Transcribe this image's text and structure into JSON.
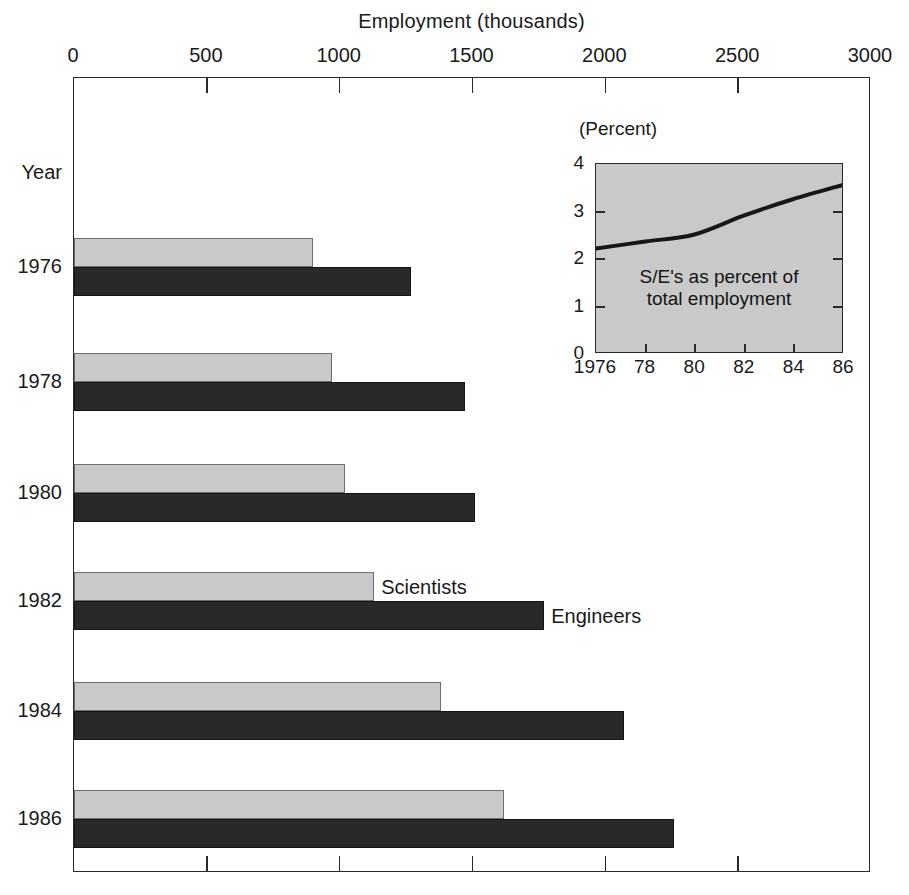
{
  "figure": {
    "axis_title": "Employment (thousands)",
    "year_axis_label": "Year",
    "background_color": "#ffffff",
    "frame_color": "#2b2b2b"
  },
  "main_axis": {
    "x_ticks": [
      0,
      500,
      1000,
      1500,
      2000,
      2500,
      3000
    ],
    "x_tick_labels": [
      "0",
      "500",
      "1000",
      "1500",
      "2000",
      "2500",
      "3000"
    ],
    "x_min": 0,
    "x_max": 3000
  },
  "years": [
    "1976",
    "1978",
    "1980",
    "1982",
    "1984",
    "1986"
  ],
  "series_annotations": [
    {
      "name": "scientists-annotation",
      "label": "Scientists"
    },
    {
      "name": "engineers-annotation",
      "label": "Engineers"
    }
  ],
  "colors": {
    "scientists": "#c9c9c9",
    "engineers": "#292929",
    "inset_background": "#c9c9c9",
    "line": "#171717"
  },
  "inset": {
    "unit_label": "(Percent)",
    "caption_line1": "S/E's as percent of",
    "caption_line2": "total employment",
    "y_ticks": [
      0,
      1,
      2,
      3,
      4
    ],
    "y_tick_labels": [
      "0",
      "1",
      "2",
      "3",
      "4"
    ],
    "x_tick_labels": [
      "1976",
      "78",
      "80",
      "82",
      "84",
      "86"
    ],
    "x_tick_values": [
      1976,
      1978,
      1980,
      1982,
      1984,
      1986
    ]
  },
  "chart_data": [
    {
      "type": "bar",
      "orientation": "horizontal",
      "title": "",
      "xlabel": "Employment (thousands)",
      "ylabel": "Year",
      "xlim": [
        0,
        3000
      ],
      "xticks": [
        0,
        500,
        1000,
        1500,
        2000,
        2500,
        3000
      ],
      "grid": false,
      "legend": "inline annotations at 1982 group",
      "categories": [
        "1976",
        "1978",
        "1980",
        "1982",
        "1984",
        "1986"
      ],
      "series": [
        {
          "name": "Scientists",
          "color": "#c9c9c9",
          "values": [
            900,
            970,
            1020,
            1130,
            1380,
            1620
          ]
        },
        {
          "name": "Engineers",
          "color": "#292929",
          "values": [
            1270,
            1470,
            1510,
            1770,
            2070,
            2260
          ]
        }
      ]
    },
    {
      "type": "line",
      "title": "S/E's as percent of total employment",
      "xlabel": "",
      "ylabel": "(Percent)",
      "ylim": [
        0,
        4
      ],
      "xlim": [
        1976,
        1986
      ],
      "yticks": [
        0,
        1,
        2,
        3,
        4
      ],
      "xticks": [
        1976,
        1978,
        1980,
        1982,
        1984,
        1986
      ],
      "grid": false,
      "legend": "none",
      "x": [
        1976,
        1978,
        1980,
        1982,
        1984,
        1986
      ],
      "series": [
        {
          "name": "S/E's as percent of total employment",
          "color": "#171717",
          "values": [
            2.2,
            2.35,
            2.5,
            2.9,
            3.25,
            3.55
          ]
        }
      ]
    }
  ]
}
